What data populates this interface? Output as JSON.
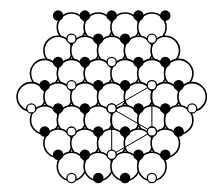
{
  "figure": {
    "title": "",
    "caption": "",
    "background_color": "#ffffff",
    "width": 208,
    "height": 185
  },
  "legend_colors": {
    "large_circle_fill": "#ffffff",
    "large_circle_stroke": "#000000",
    "filled_small_fill": "#000000",
    "open_small_fill": "#ffffff",
    "small_stroke": "#000000",
    "unit_cell_stroke": "#000000"
  },
  "geometry": {
    "large_radius": 14.2,
    "small_radius": 4.6,
    "row_spacing": 23.2,
    "col_spacing": 26.8,
    "origin_x": 104,
    "origin_y": 96,
    "large_stroke_width": 1.6,
    "small_stroke_width": 1.3,
    "unit_cell_stroke_width": 1.0
  },
  "chart_data": {
    "type": "scatter",
    "xlabel": "",
    "ylabel": "",
    "lattice": {
      "description": "Hexagonal array of large open circles arranged in rows of 4,5,6,7,6,5,4",
      "row_counts": [
        4,
        5,
        6,
        7,
        6,
        5,
        4
      ],
      "total_large_circles": 37
    },
    "large_circles": [
      {
        "x": 71.5,
        "y": 27.2
      },
      {
        "x": 98.3,
        "y": 27.2
      },
      {
        "x": 125.1,
        "y": 27.2
      },
      {
        "x": 151.9,
        "y": 27.2
      },
      {
        "x": 58.1,
        "y": 50.4
      },
      {
        "x": 84.9,
        "y": 50.4
      },
      {
        "x": 111.7,
        "y": 50.4
      },
      {
        "x": 138.5,
        "y": 50.4
      },
      {
        "x": 165.3,
        "y": 50.4
      },
      {
        "x": 44.7,
        "y": 73.6
      },
      {
        "x": 71.5,
        "y": 73.6
      },
      {
        "x": 98.3,
        "y": 73.6
      },
      {
        "x": 125.1,
        "y": 73.6
      },
      {
        "x": 151.9,
        "y": 73.6
      },
      {
        "x": 178.7,
        "y": 73.6
      },
      {
        "x": 31.3,
        "y": 96.8
      },
      {
        "x": 58.1,
        "y": 96.8
      },
      {
        "x": 84.9,
        "y": 96.8
      },
      {
        "x": 111.7,
        "y": 96.8
      },
      {
        "x": 138.5,
        "y": 96.8
      },
      {
        "x": 165.3,
        "y": 96.8
      },
      {
        "x": 192.1,
        "y": 96.8
      },
      {
        "x": 44.7,
        "y": 120.0
      },
      {
        "x": 71.5,
        "y": 120.0
      },
      {
        "x": 98.3,
        "y": 120.0
      },
      {
        "x": 125.1,
        "y": 120.0
      },
      {
        "x": 151.9,
        "y": 120.0
      },
      {
        "x": 178.7,
        "y": 120.0
      },
      {
        "x": 58.1,
        "y": 143.2
      },
      {
        "x": 84.9,
        "y": 143.2
      },
      {
        "x": 111.7,
        "y": 143.2
      },
      {
        "x": 138.5,
        "y": 143.2
      },
      {
        "x": 165.3,
        "y": 143.2
      },
      {
        "x": 71.5,
        "y": 166.4
      },
      {
        "x": 98.3,
        "y": 166.4
      },
      {
        "x": 125.1,
        "y": 166.4
      },
      {
        "x": 151.9,
        "y": 166.4
      }
    ],
    "small_circles": [
      {
        "x": 71.5,
        "y": 38.8,
        "state": "open"
      },
      {
        "x": 98.3,
        "y": 38.8,
        "state": "filled"
      },
      {
        "x": 125.1,
        "y": 38.8,
        "state": "filled"
      },
      {
        "x": 151.9,
        "y": 38.8,
        "state": "open"
      },
      {
        "x": 58.1,
        "y": 62.0,
        "state": "filled"
      },
      {
        "x": 84.9,
        "y": 62.0,
        "state": "filled"
      },
      {
        "x": 111.7,
        "y": 62.0,
        "state": "open"
      },
      {
        "x": 138.5,
        "y": 62.0,
        "state": "filled"
      },
      {
        "x": 165.3,
        "y": 62.0,
        "state": "filled"
      },
      {
        "x": 44.7,
        "y": 85.2,
        "state": "filled"
      },
      {
        "x": 71.5,
        "y": 85.2,
        "state": "open"
      },
      {
        "x": 98.3,
        "y": 85.2,
        "state": "filled"
      },
      {
        "x": 125.1,
        "y": 85.2,
        "state": "filled"
      },
      {
        "x": 151.9,
        "y": 85.2,
        "state": "open"
      },
      {
        "x": 178.7,
        "y": 85.2,
        "state": "filled"
      },
      {
        "x": 31.3,
        "y": 108.4,
        "state": "open"
      },
      {
        "x": 58.1,
        "y": 108.4,
        "state": "filled"
      },
      {
        "x": 84.9,
        "y": 108.4,
        "state": "filled"
      },
      {
        "x": 111.7,
        "y": 108.4,
        "state": "open"
      },
      {
        "x": 138.5,
        "y": 108.4,
        "state": "filled"
      },
      {
        "x": 165.3,
        "y": 108.4,
        "state": "filled"
      },
      {
        "x": 192.1,
        "y": 108.4,
        "state": "open"
      },
      {
        "x": 44.7,
        "y": 131.6,
        "state": "filled"
      },
      {
        "x": 71.5,
        "y": 131.6,
        "state": "open"
      },
      {
        "x": 98.3,
        "y": 131.6,
        "state": "filled"
      },
      {
        "x": 125.1,
        "y": 131.6,
        "state": "filled"
      },
      {
        "x": 151.9,
        "y": 131.6,
        "state": "open"
      },
      {
        "x": 178.7,
        "y": 131.6,
        "state": "filled"
      },
      {
        "x": 58.1,
        "y": 154.8,
        "state": "filled"
      },
      {
        "x": 84.9,
        "y": 154.8,
        "state": "filled"
      },
      {
        "x": 111.7,
        "y": 154.8,
        "state": "open"
      },
      {
        "x": 138.5,
        "y": 154.8,
        "state": "filled"
      },
      {
        "x": 165.3,
        "y": 154.8,
        "state": "filled"
      },
      {
        "x": 71.5,
        "y": 178.0,
        "state": "open"
      },
      {
        "x": 98.3,
        "y": 178.0,
        "state": "filled"
      },
      {
        "x": 125.1,
        "y": 178.0,
        "state": "filled"
      },
      {
        "x": 151.9,
        "y": 178.0,
        "state": "open"
      },
      {
        "x": 58.1,
        "y": 15.6,
        "state": "filled"
      },
      {
        "x": 84.9,
        "y": 15.6,
        "state": "filled"
      },
      {
        "x": 111.7,
        "y": 15.6,
        "state": "filled"
      },
      {
        "x": 138.5,
        "y": 15.6,
        "state": "filled"
      },
      {
        "x": 165.3,
        "y": 15.6,
        "state": "filled"
      }
    ],
    "unit_cell": {
      "shape": "parallelogram",
      "description": "Thin-line rhombic unit cell drawn across the central region",
      "vertices": [
        {
          "x": 151.9,
          "y": 85.2,
          "marker": "open"
        },
        {
          "x": 111.7,
          "y": 108.4,
          "marker": "open"
        },
        {
          "x": 151.9,
          "y": 131.6,
          "marker": "open"
        },
        {
          "x": 111.7,
          "y": 85.2,
          "marker": "none"
        }
      ],
      "edges": [
        {
          "from": {
            "x": 151.9,
            "y": 85.2
          },
          "to": {
            "x": 111.7,
            "y": 108.4
          }
        },
        {
          "from": {
            "x": 111.7,
            "y": 108.4
          },
          "to": {
            "x": 151.9,
            "y": 131.6
          }
        },
        {
          "from": {
            "x": 151.9,
            "y": 85.2
          },
          "to": {
            "x": 151.9,
            "y": 131.6
          }
        },
        {
          "from": {
            "x": 111.7,
            "y": 108.4
          },
          "to": {
            "x": 111.7,
            "y": 131.6
          }
        },
        {
          "from": {
            "x": 151.9,
            "y": 131.6
          },
          "to": {
            "x": 111.7,
            "y": 154.8
          }
        },
        {
          "from": {
            "x": 111.7,
            "y": 131.6
          },
          "to": {
            "x": 111.7,
            "y": 154.8
          }
        }
      ]
    }
  }
}
